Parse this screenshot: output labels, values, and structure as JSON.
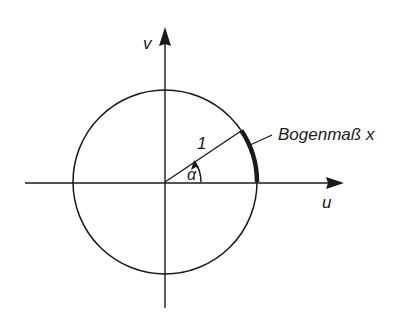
{
  "diagram": {
    "type": "unit-circle-radian",
    "axes": {
      "vertical_label": "v",
      "horizontal_label": "u"
    },
    "radius_label": "1",
    "angle_label": "α",
    "arc_label": "Bogenmaß x",
    "angle_degrees_approx": 34,
    "colors": {
      "stroke": "#1a1a1a",
      "background": "#ffffff"
    }
  }
}
